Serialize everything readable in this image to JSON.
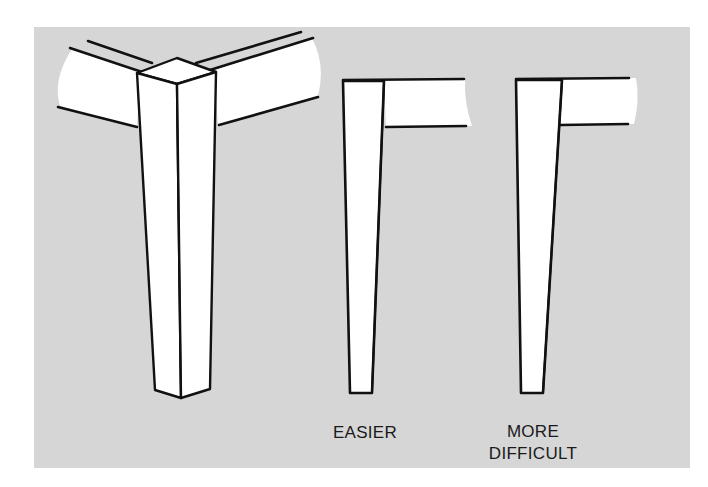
{
  "colors": {
    "background": "#ffffff",
    "panel": "#d6d6d6",
    "wood": "#ffffff",
    "line": "#111111",
    "text": "#1a1a1a"
  },
  "figures": [
    {
      "id": "corner-assembly",
      "description": "Tapered square leg joined to two aprons at a corner, shown in perspective"
    },
    {
      "id": "easier",
      "label_lines": [
        "EASIER"
      ]
    },
    {
      "id": "more-difficult",
      "label_lines": [
        "MORE",
        "DIFFICULT"
      ]
    }
  ],
  "labels": {
    "easier": "EASIER",
    "more": "MORE",
    "difficult": "DIFFICULT"
  }
}
